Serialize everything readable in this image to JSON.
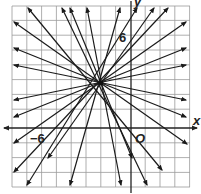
{
  "graph": {
    "center_point": {
      "x": -2,
      "y": 3
    },
    "labels": {
      "x_axis": "x",
      "y_axis": "y",
      "origin": "O",
      "y_tick": "6",
      "x_tick": "−6"
    },
    "colors": {
      "grid": "#9a9a9a",
      "axis": "#222222",
      "line": "#1a1a1a"
    },
    "grid_unit_px": 14.8,
    "line_count": 22
  }
}
